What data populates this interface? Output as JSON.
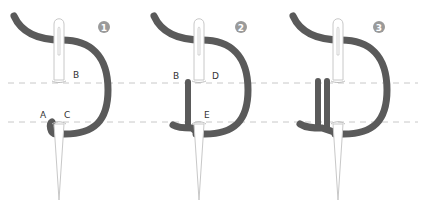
{
  "diagram": {
    "type": "embroidery-stitch-steps",
    "colors": {
      "thread": "#5a5a5a",
      "needle_stroke": "#c8c8c8",
      "guide_line": "#c8c8c8",
      "step_badge": "#9a9a9a",
      "label": "#333333"
    },
    "guide_lines_y": [
      83,
      122
    ],
    "steps": [
      {
        "number": "1",
        "labels": {
          "B": "B",
          "A": "A",
          "C": "C"
        }
      },
      {
        "number": "2",
        "labels": {
          "B": "B",
          "D": "D",
          "E": "E"
        }
      },
      {
        "number": "3",
        "labels": {}
      }
    ]
  }
}
